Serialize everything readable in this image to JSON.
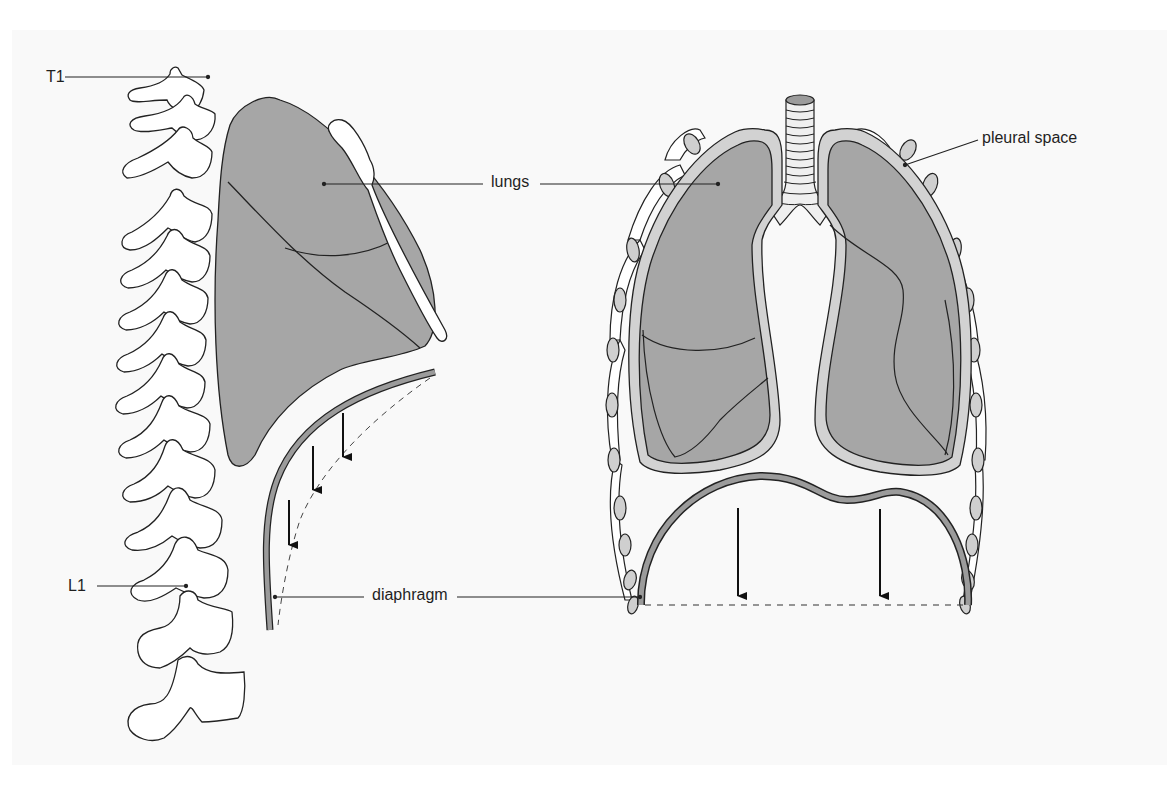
{
  "figure": {
    "type": "anatomical-diagram",
    "colors": {
      "background": "#f9f9f9",
      "lung_fill": "#a6a6a6",
      "pleura_fill": "#d2d2d2",
      "diaphragm_fill": "#9b9b9b",
      "outline": "#222222"
    }
  },
  "lateral_view": {
    "labels": {
      "t1": "T1",
      "l1": "L1"
    },
    "arrows_count": 3
  },
  "frontal_view": {
    "labels": {
      "pleural_space": "pleural space"
    },
    "arrows_count": 2
  },
  "shared_labels": {
    "lungs": "lungs",
    "diaphragm": "diaphragm"
  }
}
